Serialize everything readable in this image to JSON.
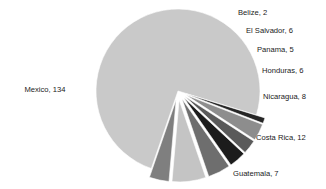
{
  "chart_data": {
    "type": "pie",
    "title": "",
    "subtitle": "",
    "xlabel": "",
    "ylabel": "",
    "legend_position": "none",
    "grid": false,
    "labels_show_value": true,
    "total": 180,
    "categories": [
      "Mexico",
      "Belize",
      "El Salvador",
      "Panama",
      "Honduras",
      "Nicaragua",
      "Costa Rica",
      "Guatemala"
    ],
    "values": [
      134,
      2,
      6,
      5,
      6,
      8,
      12,
      7
    ],
    "colors": [
      "#c9c9c9",
      "#262626",
      "#8d8d8d",
      "#5a5a5a",
      "#1c1c1c",
      "#6e6e6e",
      "#c4c4c4",
      "#7f7f7f"
    ],
    "slices": [
      {
        "name": "Mexico",
        "value": 134,
        "label": "Mexico, 134",
        "color": "#c9c9c9",
        "percent": 74.4,
        "exploded": false,
        "start_angle": 109,
        "end_angle": 377,
        "label_x": 45,
        "label_y": 90,
        "label_anchor": "middle"
      },
      {
        "name": "Belize",
        "value": 2,
        "label": "Belize, 2",
        "color": "#262626",
        "percent": 1.1,
        "exploded": true,
        "start_angle": 377,
        "end_angle": 381,
        "label_x": 238,
        "label_y": 13,
        "label_anchor": "start"
      },
      {
        "name": "El Salvador",
        "value": 6,
        "label": "El Salvador, 6",
        "color": "#8d8d8d",
        "percent": 3.3,
        "exploded": true,
        "start_angle": 381,
        "end_angle": 393,
        "label_x": 246,
        "label_y": 31,
        "label_anchor": "start"
      },
      {
        "name": "Panama",
        "value": 5,
        "label": "Panama, 5",
        "color": "#5a5a5a",
        "percent": 2.8,
        "exploded": true,
        "start_angle": 393,
        "end_angle": 403,
        "label_x": 257,
        "label_y": 50,
        "label_anchor": "start"
      },
      {
        "name": "Honduras",
        "value": 6,
        "label": "Honduras, 6",
        "color": "#1c1c1c",
        "percent": 3.3,
        "exploded": true,
        "start_angle": 403,
        "end_angle": 415,
        "label_x": 262,
        "label_y": 71,
        "label_anchor": "start"
      },
      {
        "name": "Nicaragua",
        "value": 8,
        "label": "Nicaragua, 8",
        "color": "#6e6e6e",
        "percent": 4.4,
        "exploded": true,
        "start_angle": 415,
        "end_angle": 431,
        "label_x": 263,
        "label_y": 97,
        "label_anchor": "start"
      },
      {
        "name": "Costa Rica",
        "value": 12,
        "label": "Costa Rica, 12",
        "color": "#c4c4c4",
        "percent": 6.7,
        "exploded": true,
        "start_angle": 431,
        "end_angle": 455,
        "label_x": 256,
        "label_y": 138,
        "label_anchor": "start"
      },
      {
        "name": "Guatemala",
        "value": 7,
        "label": "Guatemala, 7",
        "color": "#7f7f7f",
        "percent": 3.9,
        "exploded": true,
        "start_angle": 455,
        "end_angle": 469,
        "label_x": 233,
        "label_y": 174,
        "label_anchor": "start"
      }
    ],
    "geometry": {
      "center_x": 178,
      "center_y": 91,
      "radius": 82,
      "explode_offset": 9,
      "background": "#ffffff"
    }
  }
}
